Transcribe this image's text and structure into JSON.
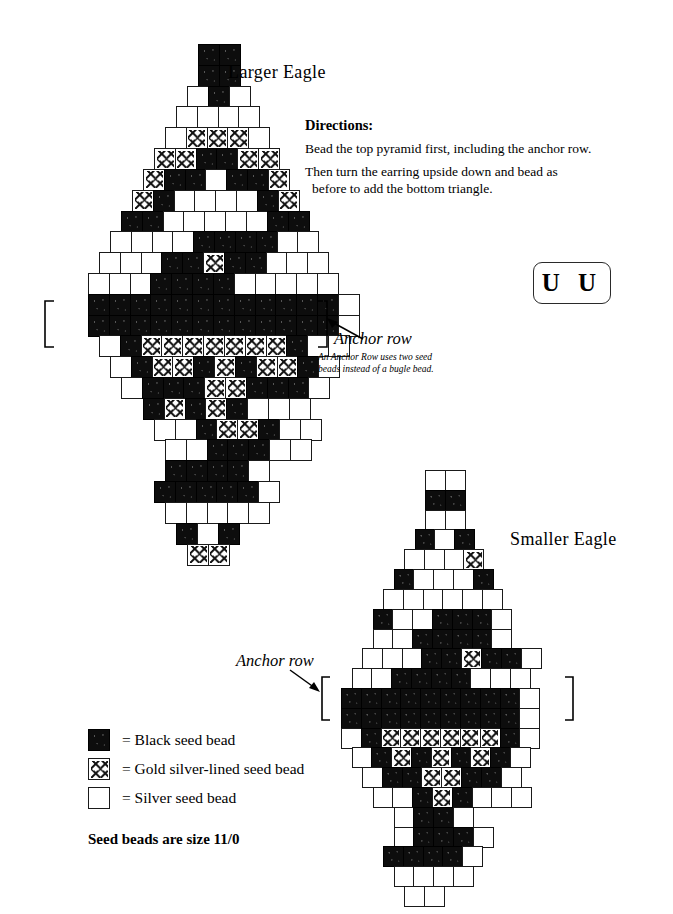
{
  "titles": {
    "larger_eagle": "Larger Eagle",
    "smaller_eagle": "Smaller Eagle"
  },
  "directions": {
    "heading": "Directions:",
    "line1": "Bead the top pyramid first, including the anchor row.",
    "line2": "Then turn the earring upside down and bead as",
    "line2b": "before to add the bottom triangle."
  },
  "uu_box": {
    "label": "U U"
  },
  "anchor": {
    "label_large": "Anchor row",
    "label_small": "Anchor row",
    "note_line1": "An Anchor Row uses two seed",
    "note_line2": "beads instead of a bugle bead."
  },
  "legend": {
    "items": [
      {
        "swatch": "black",
        "text": "= Black seed bead"
      },
      {
        "swatch": "gold",
        "text": "= Gold silver-lined seed bead"
      },
      {
        "swatch": "white",
        "text": "= Silver seed bead"
      }
    ],
    "footnote": "Seed beads are size 11/0"
  },
  "colors": {
    "black_bead": "#0d0d0d",
    "gold_bead": "#ffffff",
    "silver_bead": "#ffffff",
    "outline": "#1a1a1a",
    "page_background": "#ffffff"
  },
  "chart_data": {
    "type": "table",
    "legend_keys": {
      "B": "Black seed bead",
      "G": "Gold silver-lined seed bead",
      "W": "Silver seed bead"
    },
    "charts": [
      {
        "name": "Larger Eagle",
        "bead_size": "11/0",
        "anchor_row_indices": [
          13,
          14
        ],
        "rows": [
          {
            "offset": 5.0,
            "cells": [
              "B",
              "B"
            ]
          },
          {
            "offset": 5.0,
            "cells": [
              "B",
              "B"
            ]
          },
          {
            "offset": 4.5,
            "cells": [
              "W",
              "B",
              "W"
            ]
          },
          {
            "offset": 4.0,
            "cells": [
              "W",
              "W",
              "W",
              "W"
            ]
          },
          {
            "offset": 3.5,
            "cells": [
              "W",
              "G",
              "G",
              "G",
              "W"
            ]
          },
          {
            "offset": 3.0,
            "cells": [
              "G",
              "G",
              "B",
              "B",
              "G",
              "G"
            ]
          },
          {
            "offset": 2.5,
            "cells": [
              "G",
              "B",
              "B",
              "W",
              "B",
              "B",
              "G"
            ]
          },
          {
            "offset": 2.0,
            "cells": [
              "G",
              "B",
              "W",
              "W",
              "W",
              "W",
              "B",
              "G"
            ]
          },
          {
            "offset": 1.5,
            "cells": [
              "B",
              "B",
              "W",
              "W",
              "W",
              "W",
              "W",
              "B",
              "B"
            ]
          },
          {
            "offset": 1.0,
            "cells": [
              "W",
              "W",
              "W",
              "W",
              "B",
              "B",
              "B",
              "B",
              "W",
              "W"
            ]
          },
          {
            "offset": 0.5,
            "cells": [
              "W",
              "W",
              "W",
              "B",
              "B",
              "G",
              "B",
              "B",
              "W",
              "W",
              "W"
            ]
          },
          {
            "offset": 0.0,
            "cells": [
              "W",
              "W",
              "W",
              "B",
              "B",
              "B",
              "B",
              "W",
              "W",
              "W",
              "W",
              "W"
            ]
          },
          {
            "offset": 0.0,
            "cells": [
              "B",
              "B",
              "B",
              "B",
              "B",
              "B",
              "B",
              "B",
              "B",
              "B",
              "B",
              "B",
              "W"
            ]
          },
          {
            "offset": 0.0,
            "cells": [
              "B",
              "B",
              "B",
              "B",
              "B",
              "B",
              "B",
              "B",
              "B",
              "B",
              "B",
              "B",
              "W"
            ]
          },
          {
            "offset": 0.5,
            "cells": [
              "W",
              "B",
              "G",
              "G",
              "G",
              "G",
              "G",
              "G",
              "G",
              "B",
              "W",
              "W"
            ]
          },
          {
            "offset": 1.0,
            "cells": [
              "W",
              "B",
              "G",
              "G",
              "B",
              "G",
              "B",
              "G",
              "G",
              "B",
              "W"
            ]
          },
          {
            "offset": 1.5,
            "cells": [
              "W",
              "B",
              "B",
              "B",
              "G",
              "G",
              "B",
              "B",
              "B",
              "W"
            ]
          },
          {
            "offset": 2.5,
            "cells": [
              "B",
              "G",
              "B",
              "G",
              "B",
              "W",
              "W",
              "W"
            ]
          },
          {
            "offset": 3.0,
            "cells": [
              "W",
              "W",
              "B",
              "G",
              "G",
              "B",
              "W",
              "W"
            ]
          },
          {
            "offset": 3.5,
            "cells": [
              "W",
              "W",
              "B",
              "B",
              "B",
              "W",
              "W"
            ]
          },
          {
            "offset": 3.5,
            "cells": [
              "B",
              "B",
              "B",
              "B",
              "W"
            ]
          },
          {
            "offset": 3.0,
            "cells": [
              "B",
              "B",
              "B",
              "B",
              "B",
              "W"
            ]
          },
          {
            "offset": 3.5,
            "cells": [
              "W",
              "W",
              "W",
              "W",
              "W"
            ]
          },
          {
            "offset": 4.0,
            "cells": [
              "B",
              "W",
              "B"
            ]
          },
          {
            "offset": 4.5,
            "cells": [
              "G",
              "G"
            ]
          }
        ]
      },
      {
        "name": "Smaller Eagle",
        "bead_size": "11/0",
        "anchor_row_indices": [
          10,
          11
        ],
        "rows": [
          {
            "offset": 4.0,
            "cells": [
              "W",
              "W"
            ]
          },
          {
            "offset": 4.0,
            "cells": [
              "B",
              "B"
            ]
          },
          {
            "offset": 4.0,
            "cells": [
              "W",
              "W"
            ]
          },
          {
            "offset": 3.5,
            "cells": [
              "B",
              "W",
              "B"
            ]
          },
          {
            "offset": 3.0,
            "cells": [
              "W",
              "W",
              "W",
              "G"
            ]
          },
          {
            "offset": 2.5,
            "cells": [
              "B",
              "W",
              "W",
              "W",
              "B"
            ]
          },
          {
            "offset": 2.0,
            "cells": [
              "W",
              "W",
              "W",
              "W",
              "W",
              "W"
            ]
          },
          {
            "offset": 1.5,
            "cells": [
              "B",
              "W",
              "W",
              "B",
              "B",
              "B",
              "W"
            ]
          },
          {
            "offset": 1.5,
            "cells": [
              "W",
              "W",
              "B",
              "B",
              "B",
              "B",
              "W"
            ]
          },
          {
            "offset": 1.0,
            "cells": [
              "W",
              "W",
              "W",
              "B",
              "B",
              "G",
              "B",
              "B",
              "W"
            ]
          },
          {
            "offset": 0.5,
            "cells": [
              "W",
              "W",
              "B",
              "B",
              "B",
              "B",
              "W",
              "W",
              "W"
            ]
          },
          {
            "offset": 0.0,
            "cells": [
              "B",
              "B",
              "B",
              "B",
              "B",
              "B",
              "B",
              "B",
              "B",
              "W"
            ]
          },
          {
            "offset": 0.0,
            "cells": [
              "B",
              "B",
              "B",
              "B",
              "B",
              "B",
              "B",
              "B",
              "B",
              "W"
            ]
          },
          {
            "offset": 0.0,
            "cells": [
              "W",
              "B",
              "G",
              "G",
              "G",
              "G",
              "G",
              "G",
              "B",
              "W"
            ]
          },
          {
            "offset": 0.5,
            "cells": [
              "W",
              "B",
              "G",
              "B",
              "G",
              "B",
              "G",
              "B",
              "W"
            ]
          },
          {
            "offset": 1.0,
            "cells": [
              "W",
              "B",
              "B",
              "G",
              "G",
              "B",
              "B",
              "W"
            ]
          },
          {
            "offset": 1.5,
            "cells": [
              "W",
              "W",
              "B",
              "G",
              "B",
              "W",
              "W",
              "W"
            ]
          },
          {
            "offset": 2.5,
            "cells": [
              "W",
              "B",
              "B",
              "W"
            ]
          },
          {
            "offset": 2.5,
            "cells": [
              "W",
              "B",
              "B",
              "B",
              "W"
            ]
          },
          {
            "offset": 2.0,
            "cells": [
              "B",
              "B",
              "B",
              "B",
              "W"
            ]
          },
          {
            "offset": 2.5,
            "cells": [
              "W",
              "W",
              "W",
              "W"
            ]
          },
          {
            "offset": 3.0,
            "cells": [
              "W",
              "W"
            ]
          }
        ]
      }
    ]
  }
}
